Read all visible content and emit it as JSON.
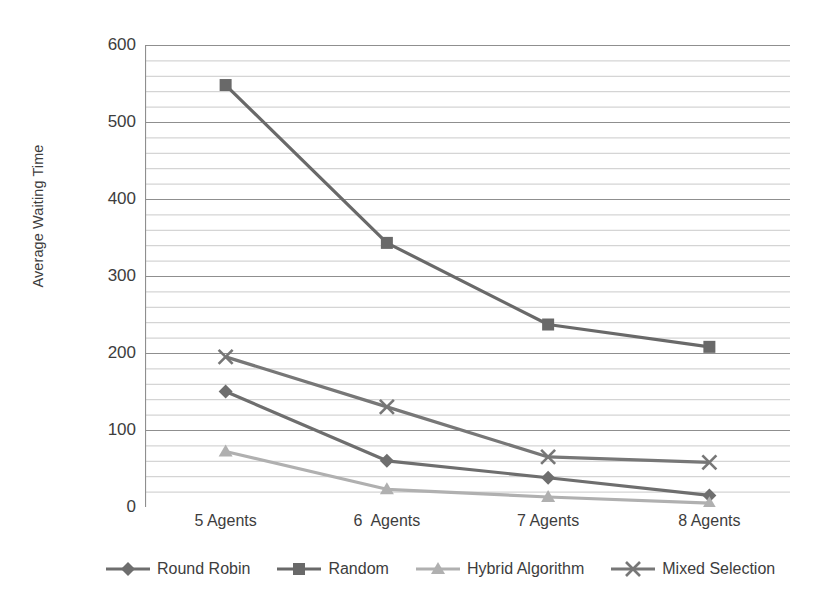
{
  "chart_data": {
    "type": "line",
    "title": "",
    "xlabel": "",
    "ylabel": "Average Waiting Time",
    "categories": [
      "5 Agents",
      "6  Agents",
      "7 Agents",
      "8 Agents"
    ],
    "ylim": [
      0,
      600
    ],
    "y_ticks": [
      0,
      100,
      200,
      300,
      400,
      500,
      600
    ],
    "y_minor_step": 20,
    "grid": "horizontal",
    "legend_position": "bottom",
    "series": [
      {
        "name": "Round Robin",
        "marker": "diamond",
        "color": "#6e6e6e",
        "values": [
          150,
          60,
          38,
          15
        ]
      },
      {
        "name": "Random",
        "marker": "square",
        "color": "#696969",
        "values": [
          548,
          343,
          237,
          208
        ]
      },
      {
        "name": "Hybrid Algorithm",
        "marker": "triangle",
        "color": "#b0b0b0",
        "values": [
          72,
          23,
          13,
          5
        ]
      },
      {
        "name": "Mixed Selection",
        "marker": "cross",
        "color": "#777777",
        "values": [
          195,
          130,
          65,
          58
        ]
      }
    ]
  },
  "axes": {
    "y_title": "Average Waiting Time",
    "y_tick_labels": [
      "600",
      "500",
      "400",
      "300",
      "200",
      "100",
      "0"
    ],
    "x_tick_labels": [
      "5 Agents",
      "6  Agents",
      "7 Agents",
      "8 Agents"
    ]
  },
  "legend": {
    "items": [
      {
        "label": "Round Robin"
      },
      {
        "label": "Random"
      },
      {
        "label": "Hybrid Algorithm"
      },
      {
        "label": "Mixed Selection"
      }
    ]
  },
  "style": {
    "background": "#ffffff",
    "axis_color": "#9a9a9a",
    "grid_color": "#bdbdbd",
    "text_color": "#3d3d3d"
  }
}
